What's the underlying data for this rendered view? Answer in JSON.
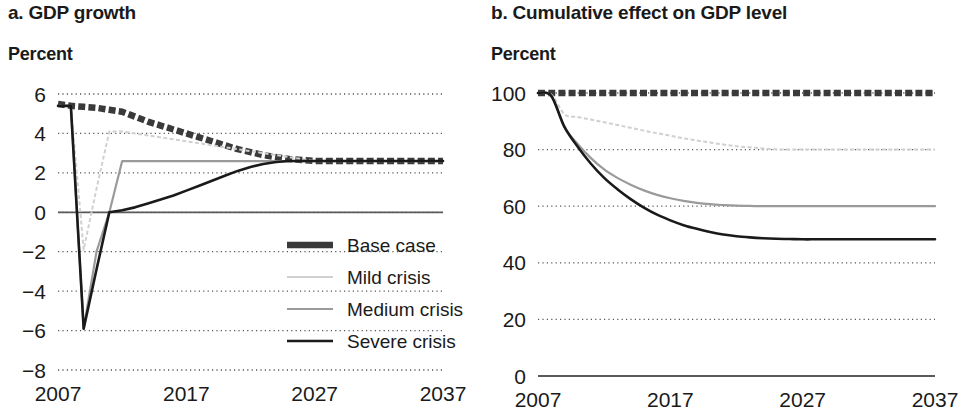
{
  "figure": {
    "panels": [
      {
        "id": "a",
        "title": "a. GDP growth",
        "unit_label": "Percent"
      },
      {
        "id": "b",
        "title": "b. Cumulative effect on GDP level",
        "unit_label": "Percent"
      }
    ],
    "legend": {
      "items": [
        {
          "label": "Base case",
          "color": "#3a3a3a",
          "style": "thick-dashed"
        },
        {
          "label": "Mild crisis",
          "color": "#d0d0d0",
          "style": "thin-dashed"
        },
        {
          "label": "Medium crisis",
          "color": "#9a9a9a",
          "style": "solid"
        },
        {
          "label": "Severe crisis",
          "color": "#1a1a1a",
          "style": "solid"
        }
      ]
    }
  },
  "chart_data": [
    {
      "type": "line",
      "panel": "a",
      "title": "a. GDP growth",
      "xlabel": "",
      "ylabel": "Percent",
      "xlim": [
        2007,
        2037
      ],
      "ylim": [
        -8,
        6
      ],
      "yticks": [
        6,
        4,
        2,
        0,
        -2,
        -4,
        -6,
        -8
      ],
      "ytick_labels": [
        "6",
        "4",
        "2",
        "0",
        "−2",
        "−4",
        "−6",
        "−8"
      ],
      "xticks": [
        2007,
        2017,
        2027,
        2037
      ],
      "xtick_labels": [
        "2007",
        "2017",
        "2027",
        "2037"
      ],
      "grid": "horizontal-dotted",
      "zero_line": true,
      "legend_position": "inside-lower-right",
      "x": [
        2007,
        2008,
        2009,
        2010,
        2011,
        2012,
        2013,
        2014,
        2015,
        2016,
        2017,
        2018,
        2019,
        2020,
        2021,
        2022,
        2023,
        2024,
        2025,
        2026,
        2027,
        2028,
        2029,
        2030,
        2031,
        2032,
        2033,
        2034,
        2035,
        2036,
        2037
      ],
      "series": [
        {
          "name": "Base case",
          "color": "#3a3a3a",
          "values": [
            5.5,
            5.4,
            5.35,
            5.3,
            5.2,
            5.1,
            4.85,
            4.6,
            4.4,
            4.2,
            4.0,
            3.8,
            3.6,
            3.4,
            3.2,
            3.05,
            2.9,
            2.8,
            2.7,
            2.65,
            2.6,
            2.6,
            2.6,
            2.6,
            2.6,
            2.6,
            2.6,
            2.6,
            2.6,
            2.6,
            2.6
          ]
        },
        {
          "name": "Mild crisis",
          "color": "#d0d0d0",
          "values": [
            5.4,
            5.4,
            -1.9,
            1.2,
            4.1,
            4.1,
            4.0,
            3.9,
            3.8,
            3.7,
            3.6,
            3.5,
            3.4,
            3.3,
            3.2,
            3.1,
            3.0,
            2.9,
            2.8,
            2.7,
            2.6,
            2.6,
            2.6,
            2.6,
            2.6,
            2.6,
            2.6,
            2.6,
            2.6,
            2.6,
            2.6
          ]
        },
        {
          "name": "Medium crisis",
          "color": "#9a9a9a",
          "values": [
            5.4,
            5.4,
            -5.9,
            -2.0,
            0.0,
            2.6,
            2.6,
            2.6,
            2.6,
            2.6,
            2.6,
            2.6,
            2.6,
            2.6,
            2.6,
            2.6,
            2.6,
            2.6,
            2.6,
            2.6,
            2.6,
            2.6,
            2.6,
            2.6,
            2.6,
            2.6,
            2.6,
            2.6,
            2.6,
            2.6,
            2.6
          ]
        },
        {
          "name": "Severe crisis",
          "color": "#1a1a1a",
          "values": [
            5.4,
            5.4,
            -5.9,
            -2.9,
            0.0,
            0.1,
            0.25,
            0.45,
            0.65,
            0.85,
            1.1,
            1.35,
            1.6,
            1.85,
            2.1,
            2.3,
            2.45,
            2.55,
            2.6,
            2.6,
            2.6,
            2.6,
            2.6,
            2.6,
            2.6,
            2.6,
            2.6,
            2.6,
            2.6,
            2.6,
            2.6
          ]
        }
      ]
    },
    {
      "type": "line",
      "panel": "b",
      "title": "b. Cumulative effect on GDP level",
      "xlabel": "",
      "ylabel": "Percent",
      "xlim": [
        2007,
        2037
      ],
      "ylim": [
        0,
        100
      ],
      "yticks": [
        100,
        80,
        60,
        40,
        20,
        0
      ],
      "ytick_labels": [
        "100",
        "80",
        "60",
        "40",
        "20",
        "0"
      ],
      "xticks": [
        2007,
        2017,
        2027,
        2037
      ],
      "xtick_labels": [
        "2007",
        "2017",
        "2027",
        "2037"
      ],
      "grid": "horizontal-dotted",
      "zero_line": true,
      "legend_position": "none",
      "x": [
        2007,
        2008,
        2009,
        2010,
        2011,
        2012,
        2013,
        2014,
        2015,
        2016,
        2017,
        2018,
        2019,
        2020,
        2021,
        2022,
        2023,
        2024,
        2025,
        2026,
        2027,
        2028,
        2029,
        2030,
        2031,
        2032,
        2033,
        2034,
        2035,
        2036,
        2037
      ],
      "series": [
        {
          "name": "Base case",
          "color": "#3a3a3a",
          "values": [
            100,
            100,
            100,
            100,
            100,
            100,
            100,
            100,
            100,
            100,
            100,
            100,
            100,
            100,
            100,
            100,
            100,
            100,
            100,
            100,
            100,
            100,
            100,
            100,
            100,
            100,
            100,
            100,
            100,
            100,
            100
          ]
        },
        {
          "name": "Mild crisis",
          "color": "#d0d0d0",
          "values": [
            100,
            99.5,
            92.5,
            91.5,
            90.6,
            89.7,
            88.7,
            87.7,
            86.7,
            85.8,
            84.9,
            84.0,
            83.2,
            82.5,
            81.8,
            81.2,
            80.8,
            80.4,
            80.1,
            80.0,
            80.0,
            80.0,
            80.0,
            80.0,
            80.0,
            80.0,
            80.0,
            80.0,
            80.0,
            80.0,
            80.0
          ]
        },
        {
          "name": "Medium crisis",
          "color": "#9a9a9a",
          "values": [
            100,
            99.0,
            88.0,
            82.0,
            77.0,
            73.0,
            70.0,
            67.6,
            65.6,
            64.0,
            62.8,
            61.9,
            61.2,
            60.7,
            60.4,
            60.2,
            60.1,
            60.0,
            60.0,
            60.0,
            60.0,
            60.0,
            60.0,
            60.0,
            60.0,
            60.0,
            60.0,
            60.0,
            60.0,
            60.0,
            60.0
          ]
        },
        {
          "name": "Severe crisis",
          "color": "#1a1a1a",
          "values": [
            100,
            99.0,
            88.0,
            81.0,
            75.0,
            70.0,
            66.0,
            62.5,
            59.5,
            57.0,
            55.0,
            53.3,
            52.0,
            50.9,
            50.0,
            49.4,
            49.0,
            48.7,
            48.5,
            48.4,
            48.3,
            48.3,
            48.3,
            48.3,
            48.3,
            48.3,
            48.3,
            48.3,
            48.3,
            48.3,
            48.3
          ]
        }
      ]
    }
  ]
}
